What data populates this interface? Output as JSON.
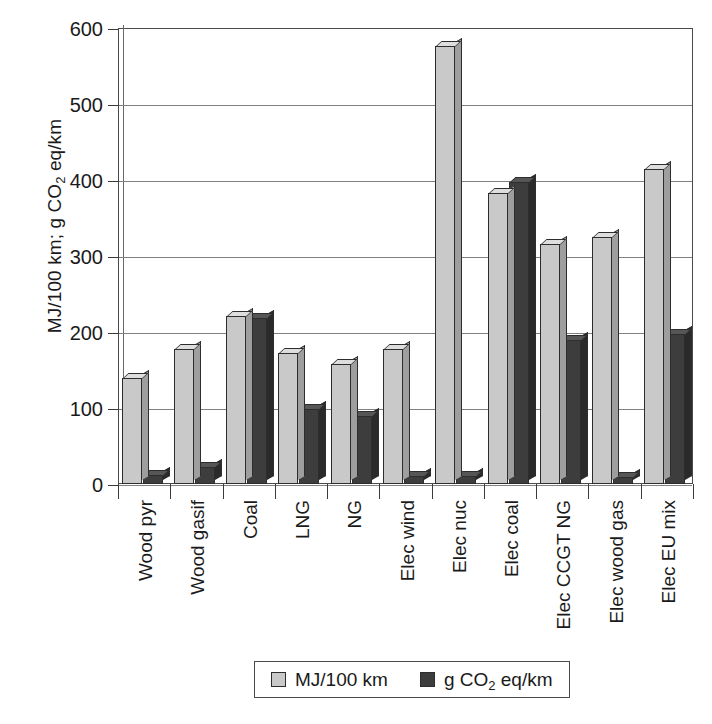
{
  "chart_data": {
    "type": "bar",
    "title": "",
    "xlabel": "",
    "ylabel": "MJ/100 km; g CO2 eq/km",
    "ylabel_parts": {
      "pre": "MJ/100 km; g CO",
      "sub": "2",
      "post": " eq/km"
    },
    "ylim": [
      0,
      600
    ],
    "yticks": [
      0,
      100,
      200,
      300,
      400,
      500,
      600
    ],
    "ytick_labels": [
      "0",
      "100",
      "200",
      "300",
      "400",
      "500",
      "600"
    ],
    "grid": true,
    "legend_position": "bottom",
    "categories": [
      "Wood pyr",
      "Wood gasif",
      "Coal",
      "LNG",
      "NG",
      "Elec wind",
      "Elec nuc",
      "Elec coal",
      "Elec CCGT NG",
      "Elec wood gas",
      "Elec EU mix"
    ],
    "series": [
      {
        "name": "MJ/100 km",
        "color": "#c9c9c9",
        "values": [
          139,
          178,
          221,
          173,
          158,
          178,
          576,
          383,
          316,
          325,
          415
        ]
      },
      {
        "name": "g CO2 eq/km",
        "color": "#3d3d3d",
        "values": [
          12,
          22,
          218,
          99,
          89,
          11,
          10,
          397,
          189,
          9,
          197
        ]
      }
    ]
  },
  "legend": {
    "items": [
      {
        "label": "MJ/100 km",
        "swatch": "#c9c9c9",
        "sub": "",
        "pre": "MJ/100 km",
        "post": ""
      },
      {
        "label": "g CO2 eq/km",
        "swatch": "#3d3d3d",
        "sub": "2",
        "pre": "g CO",
        "post": " eq/km"
      }
    ]
  },
  "colors": {
    "series_light": "#c9c9c9",
    "series_dark": "#3d3d3d",
    "axis": "#3a3a3a",
    "grid": "#808080",
    "background": "#ffffff"
  }
}
